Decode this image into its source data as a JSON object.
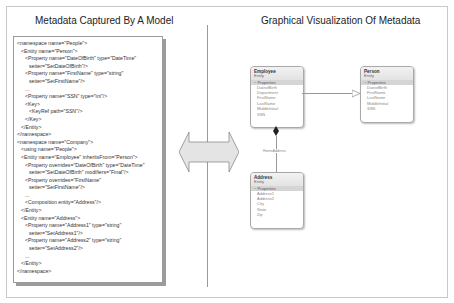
{
  "left_panel": {
    "title": "Metadata Captured By A Model",
    "code_lines": [
      {
        "indent": 0,
        "text": "<namespace name=\"People\">"
      },
      {
        "indent": 1,
        "text": "<Entity name=\"Person\">"
      },
      {
        "indent": 2,
        "text": "<Property name=\"DateOfBirth\" type=\"DateTime\""
      },
      {
        "indent": 3,
        "text": "setter=\"SetDateOfBirth\"/>"
      },
      {
        "indent": 2,
        "text": "<Property name=\"FirstName\" type=\"string\""
      },
      {
        "indent": 3,
        "text": "setter=\"SetFirstName\"/>"
      },
      {
        "indent": 2,
        "text": "..."
      },
      {
        "indent": 2,
        "text": "<Property name=\"SSN\" type=\"int\"/>"
      },
      {
        "indent": 2,
        "text": "<Key>"
      },
      {
        "indent": 3,
        "text": "<KeyRef path=\"SSN\"/>"
      },
      {
        "indent": 2,
        "text": "</Key>"
      },
      {
        "indent": 1,
        "text": "</Entity>"
      },
      {
        "indent": 0,
        "text": "</namespace>"
      },
      {
        "indent": 0,
        "text": "<namespace name=\"Company\">"
      },
      {
        "indent": 1,
        "text": "<using name=\"People\">"
      },
      {
        "indent": 1,
        "text": "<Entity name=\"Employee\" inheritsFrom=\"Person\">"
      },
      {
        "indent": 2,
        "text": "<Property overrides=\"DateOfBirth\" type=\"DateTime\""
      },
      {
        "indent": 3,
        "text": "setter=\"SetDateOfBirth\" modifiers=\"Final\"/>"
      },
      {
        "indent": 2,
        "text": "<Property overrides=\"FirstName\""
      },
      {
        "indent": 3,
        "text": "setter=\"SetFirstName\"/>"
      },
      {
        "indent": 2,
        "text": "..."
      },
      {
        "indent": 2,
        "text": "<Composition entity=\"Address\"/>"
      },
      {
        "indent": 1,
        "text": "</Entity>"
      },
      {
        "indent": 1,
        "text": "<Entity name=\"Address\">"
      },
      {
        "indent": 2,
        "text": "<Property name=\"Address1\" type=\"string\""
      },
      {
        "indent": 3,
        "text": "setter=\"SetAddress1\"/>"
      },
      {
        "indent": 2,
        "text": "<Property name=\"Address2\" type=\"string\""
      },
      {
        "indent": 3,
        "text": "setter=\"SetAddress2\"/>"
      },
      {
        "indent": 2,
        "text": "..."
      },
      {
        "indent": 1,
        "text": "</Entity>"
      },
      {
        "indent": 0,
        "text": "</namespace>"
      }
    ]
  },
  "center": {
    "arrow_icon": "double-headed-arrow",
    "arrow_color": "#e4e4e4"
  },
  "right_panel": {
    "title": "Graphical Visualization Of Metadata",
    "entities": [
      {
        "name": "Employee",
        "kind": "Entity",
        "section": "Properties",
        "properties": [
          "DateofBirth",
          "Department",
          "FirstName",
          "LastName",
          "MiddleInitial",
          "SSN"
        ]
      },
      {
        "name": "Person",
        "kind": "Entity",
        "section": "Properties",
        "properties": [
          "DateofBirth",
          "FirstName",
          "LastName",
          "MiddleInitial",
          "SSN"
        ]
      },
      {
        "name": "Address",
        "kind": "Entity",
        "section": "Properties",
        "properties": [
          "Address1",
          "Address2",
          "City",
          "State",
          "Zip"
        ]
      }
    ],
    "composition_label": "HomeAddress"
  }
}
